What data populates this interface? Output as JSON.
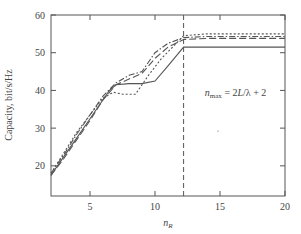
{
  "chart_data": {
    "type": "line",
    "title": "",
    "xlabel": "n_R",
    "ylabel": "Capacity, bit/s/Hz",
    "xlim": [
      2,
      20
    ],
    "ylim": [
      12,
      60
    ],
    "xticks": [
      5,
      10,
      15,
      20
    ],
    "yticks": [
      20,
      30,
      40,
      50,
      60
    ],
    "grid": false,
    "legend": null,
    "annotations": [
      {
        "text": "n_max = 2L/λ + 2",
        "x": 16.2,
        "y": 38.5
      },
      {
        "type": "vline",
        "x": 12.2,
        "style": "dashed"
      }
    ],
    "series": [
      {
        "name": "solid",
        "style": "solid",
        "x": [
          2,
          3,
          4,
          5,
          6,
          6.5,
          7,
          8,
          9,
          10,
          11,
          12.2,
          14,
          16,
          18,
          20
        ],
        "y": [
          17.5,
          22.5,
          27.5,
          32.5,
          37.5,
          40.0,
          41.5,
          41.8,
          41.8,
          42.5,
          46.5,
          51.5,
          51.5,
          51.5,
          51.5,
          51.5
        ]
      },
      {
        "name": "dotted",
        "style": "dotted",
        "x": [
          2,
          3,
          4,
          5,
          6,
          6.8,
          7.5,
          8.5,
          9.5,
          10.5,
          11.5,
          12.2,
          14,
          16,
          18,
          20
        ],
        "y": [
          18.0,
          23.5,
          29.0,
          33.5,
          38.0,
          39.5,
          39.0,
          39.0,
          44.0,
          48.5,
          52.0,
          54.5,
          55.0,
          55.0,
          55.0,
          55.0
        ]
      },
      {
        "name": "dash-dot",
        "style": "dash-dot",
        "x": [
          2,
          3,
          4,
          5,
          6,
          7,
          8,
          9,
          10,
          11,
          12.2,
          14,
          16,
          18,
          20
        ],
        "y": [
          18.0,
          23.0,
          28.5,
          33.5,
          38.5,
          42.0,
          44.0,
          45.0,
          50.0,
          52.5,
          54.0,
          54.3,
          54.3,
          54.3,
          54.3
        ]
      },
      {
        "name": "long-dash",
        "style": "long-dash",
        "x": [
          2,
          3,
          4,
          5,
          6,
          7,
          8,
          9,
          10,
          11,
          12.2,
          14,
          16,
          18,
          20
        ],
        "y": [
          17.5,
          22.0,
          27.0,
          32.0,
          37.5,
          41.5,
          43.0,
          44.5,
          48.5,
          51.5,
          53.5,
          53.8,
          53.8,
          53.8,
          53.8
        ]
      }
    ]
  },
  "plot": {
    "color": "#555555",
    "area": {
      "left": 51,
      "right": 285,
      "top": 15,
      "bottom": 196
    }
  }
}
